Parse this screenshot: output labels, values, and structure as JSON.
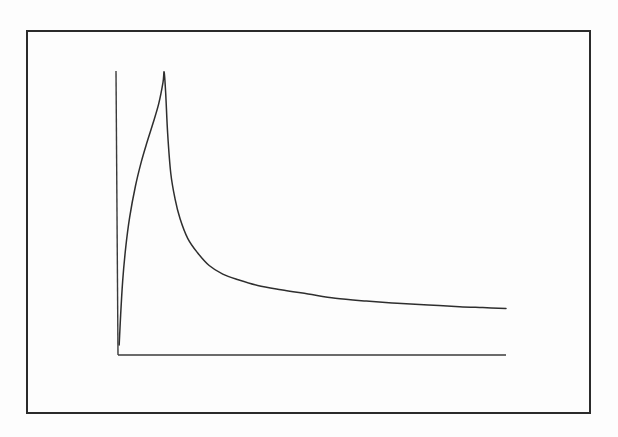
{
  "figure": {
    "kind": "line-chart",
    "width": 618,
    "height": 437,
    "background_color": "#fdfdfd",
    "frame": {
      "name": "figure-border",
      "x": 27,
      "y": 31,
      "width": 563,
      "height": 382,
      "stroke_color": "#2b2b2b",
      "stroke_width": 1.6
    },
    "title": "",
    "caption": "",
    "annotations": []
  },
  "axes": {
    "stroke_color": "#3a3a3a",
    "stroke_width": 1.4,
    "origin": {
      "x": 118,
      "y": 355
    },
    "y_axis": {
      "name": "y-axis-line",
      "x1": 116,
      "y1": 71,
      "x2": 118,
      "y2": 355
    },
    "x_axis": {
      "name": "x-axis-line",
      "x1": 118,
      "y1": 355,
      "x2": 506,
      "y2": 355
    },
    "x_tick_labels": [],
    "y_tick_labels": [],
    "xlabel": "",
    "ylabel": "",
    "grid": "off",
    "legend": "none"
  },
  "chart_data": {
    "type": "line",
    "title": "",
    "subtitle": "",
    "xlabel": "",
    "ylabel": "",
    "xlim": [
      0,
      100
    ],
    "ylim": [
      0,
      100
    ],
    "grid": false,
    "legend_position": "none",
    "tick_labels": {
      "x": [],
      "y": []
    },
    "annotations": [],
    "series": [
      {
        "name": "spike-decay",
        "stroke_color": "#2e2e2e",
        "stroke_width": 1.5,
        "x": [
          0.3,
          0.6,
          1.2,
          2.0,
          3.0,
          4.5,
          6.0,
          7.5,
          9.0,
          10.5,
          11.6,
          11.9,
          12.3,
          12.8,
          13.6,
          14.7,
          16.0,
          18.0,
          20.5,
          23.5,
          27.0,
          31.0,
          36.0,
          42.0,
          49.0,
          56.0,
          64.0,
          72.0,
          80.0,
          88.0,
          94.0,
          100.0
        ],
        "y": [
          3.5,
          12.0,
          26.0,
          38.0,
          48.5,
          59.5,
          68.0,
          75.0,
          81.5,
          88.5,
          96.0,
          99.6,
          92.0,
          78.0,
          64.0,
          55.0,
          48.0,
          41.0,
          36.0,
          31.5,
          28.5,
          26.5,
          24.5,
          23.0,
          21.5,
          20.0,
          19.0,
          18.2,
          17.6,
          17.0,
          16.7,
          16.4
        ]
      }
    ],
    "peak": {
      "x": 11.9,
      "y": 99.6
    },
    "end_point": {
      "x": 100.0,
      "y": 16.4
    },
    "start_point": {
      "x": 0.3,
      "y": 3.5
    }
  },
  "path_geometry": {
    "curve_path_d": "M 119.2 344.6 C 121.6 330.0 124.2 296.0 128.5 258.0 C 133.0 218.0 140.0 170.0 147.5 131.0 C 153.5 100.0 158.8 80.0 163.2 72.0 C 165.6 79.0 168.0 110.0 170.8 150.0 C 173.2 184.0 176.0 213.0 180.5 236.0 C 186.0 253.0 194.0 262.0 205.0 269.0 C 222.0 277.0 243.0 281.0 268.0 285.5 C 300.0 290.0 334.0 293.0 372.0 296.0 C 412.0 299.0 455.0 300.8 506.0 302.0",
    "units": "screenshot pixels"
  }
}
